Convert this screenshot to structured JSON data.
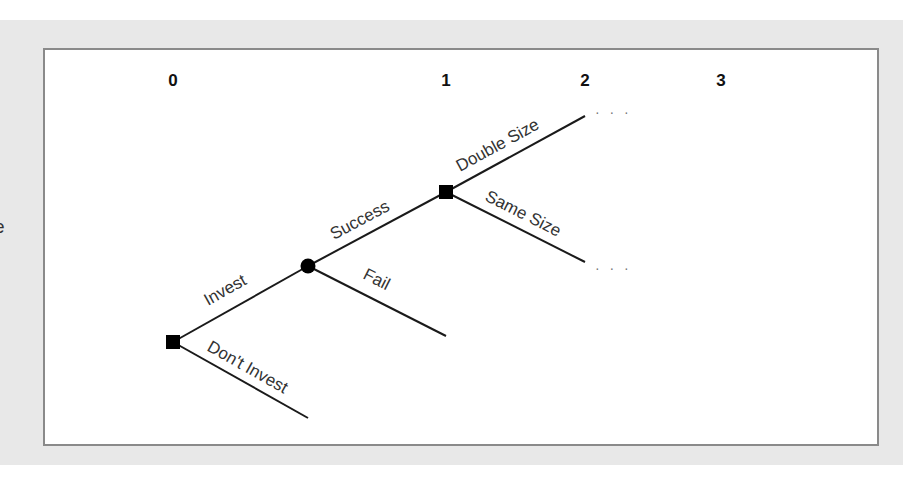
{
  "left_cutoff_text": "e",
  "periods": [
    {
      "label": "0",
      "x": 173
    },
    {
      "label": "1",
      "x": 446
    },
    {
      "label": "2",
      "x": 585
    },
    {
      "label": "3",
      "x": 721
    }
  ],
  "nodes": {
    "decision_invest": {
      "type": "decision",
      "shape": "square"
    },
    "chance_outcome": {
      "type": "chance",
      "shape": "circle"
    },
    "decision_expand": {
      "type": "decision",
      "shape": "square"
    }
  },
  "branches": {
    "invest": "Invest",
    "dont_invest": "Don't Invest",
    "success": "Success",
    "fail": "Fail",
    "double_size": "Double Size",
    "same_size": "Same Size"
  },
  "continuation": "· · ·",
  "colors": {
    "background_band": "#e8e8e8",
    "panel_border": "#8a8a8a",
    "line": "#1a1a1a",
    "label": "#333333"
  }
}
